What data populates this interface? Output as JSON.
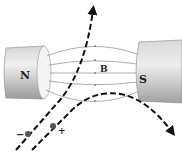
{
  "diagram": {
    "type": "physics",
    "labels": {
      "north_pole": "N",
      "south_pole": "S",
      "field": "B",
      "negative_charge": "−",
      "positive_charge": "+"
    },
    "colors": {
      "magnet_light": "#e6e6e6",
      "magnet_dark": "#a8a8a8",
      "field_line": "#8a8a8a",
      "trajectory": "#111111",
      "particle": "#555555"
    }
  }
}
